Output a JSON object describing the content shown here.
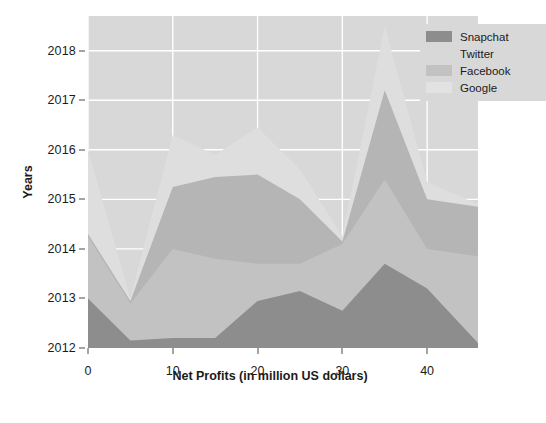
{
  "chart_data": {
    "type": "area",
    "stacked": true,
    "title": "",
    "xlabel": "Net Profits (in million US dollars)",
    "ylabel": "Years",
    "xlim": [
      0,
      46
    ],
    "ylim": [
      2012,
      2018.7
    ],
    "xticks": [
      0,
      10,
      20,
      30,
      40
    ],
    "yticks": [
      2012,
      2013,
      2014,
      2015,
      2016,
      2017,
      2018
    ],
    "grid": true,
    "legend_position": "top-right",
    "x": [
      0,
      5,
      10,
      15,
      20,
      25,
      30,
      35,
      40,
      46
    ],
    "series": [
      {
        "name": "Snapchat",
        "color": "#8d8d8d",
        "values": [
          2013.0,
          2012.15,
          2012.2,
          2012.2,
          2012.95,
          2013.15,
          2012.75,
          2013.7,
          2013.2,
          2012.1
        ]
      },
      {
        "name": "Twitter",
        "color": "#c2c2c2",
        "values": [
          2014.25,
          2012.9,
          2014.0,
          2013.8,
          2013.7,
          2013.7,
          2014.1,
          2015.4,
          2014.0,
          2013.85
        ]
      },
      {
        "name": "Facebook",
        "color": "#b5b5b5",
        "values": [
          2014.3,
          2012.95,
          2015.25,
          2015.45,
          2015.5,
          2015.0,
          2014.15,
          2017.2,
          2015.0,
          2014.85
        ]
      },
      {
        "name": "Google",
        "color": "#dedede",
        "values": [
          2016.0,
          2013.0,
          2016.3,
          2015.9,
          2016.45,
          2015.6,
          2014.25,
          2018.5,
          2015.35,
          2014.9
        ]
      }
    ],
    "legend": [
      "Snapchat",
      "Twitter",
      "Facebook",
      "Google"
    ]
  },
  "axes": {
    "y_title": "Years",
    "x_title": "Net Profits (in million US dollars)",
    "y_tick_labels": [
      "2018",
      "2017",
      "2016",
      "2015",
      "2014",
      "2013",
      "2012"
    ],
    "x_tick_labels": [
      "0",
      "10",
      "20",
      "30",
      "40"
    ]
  },
  "legend": {
    "items": [
      {
        "label": "Snapchat",
        "color": "#8d8d8d"
      },
      {
        "label": "Twitter",
        "color": "#d8d8d8"
      },
      {
        "label": "Facebook",
        "color": "#c2c2c2"
      },
      {
        "label": "Google",
        "color": "#e2e2e2"
      }
    ]
  },
  "caption": "",
  "style": {
    "plot_background": "#d8d8d8",
    "grid_color": "#ffffff",
    "text_color": "#1b1b1b"
  }
}
